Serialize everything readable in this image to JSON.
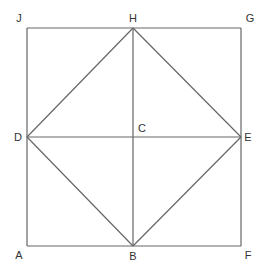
{
  "diagram": {
    "type": "geometry",
    "line_color": "#666666",
    "label_color": "#333333",
    "points": {
      "J": {
        "label": "J",
        "x": 27,
        "y": 28
      },
      "H": {
        "label": "H",
        "x": 133,
        "y": 28
      },
      "G": {
        "label": "G",
        "x": 241,
        "y": 28
      },
      "D": {
        "label": "D",
        "x": 27,
        "y": 137
      },
      "C": {
        "label": "C",
        "x": 133,
        "y": 137
      },
      "E": {
        "label": "E",
        "x": 241,
        "y": 137
      },
      "A": {
        "label": "A",
        "x": 27,
        "y": 246
      },
      "B": {
        "label": "B",
        "x": 133,
        "y": 246
      },
      "F": {
        "label": "F",
        "x": 241,
        "y": 246
      }
    },
    "segments": [
      [
        "J",
        "G"
      ],
      [
        "G",
        "F"
      ],
      [
        "F",
        "A"
      ],
      [
        "A",
        "J"
      ],
      [
        "H",
        "E"
      ],
      [
        "E",
        "B"
      ],
      [
        "B",
        "D"
      ],
      [
        "D",
        "H"
      ],
      [
        "D",
        "E"
      ],
      [
        "H",
        "B"
      ]
    ],
    "labels": [
      {
        "text": "J",
        "x": 19,
        "y": 22
      },
      {
        "text": "H",
        "x": 133,
        "y": 22
      },
      {
        "text": "G",
        "x": 250,
        "y": 22
      },
      {
        "text": "D",
        "x": 18,
        "y": 141
      },
      {
        "text": "C",
        "x": 142,
        "y": 132
      },
      {
        "text": "E",
        "x": 248,
        "y": 141
      },
      {
        "text": "A",
        "x": 19,
        "y": 259
      },
      {
        "text": "B",
        "x": 133,
        "y": 260
      },
      {
        "text": "F",
        "x": 248,
        "y": 259
      }
    ]
  }
}
